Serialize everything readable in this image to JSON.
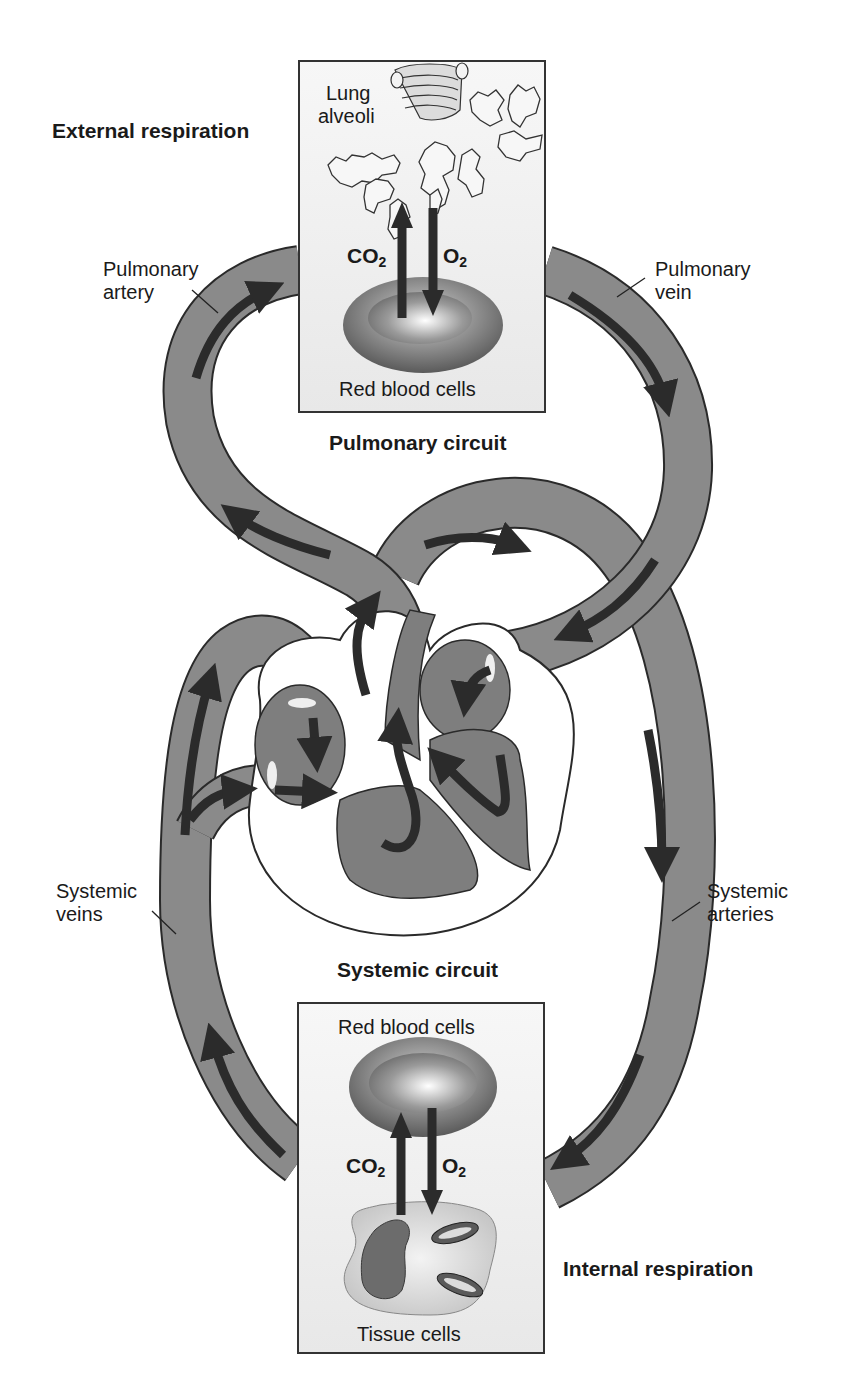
{
  "diagram": {
    "type": "circulatory-system",
    "colors": {
      "vessel_fill": "#8a8a8a",
      "vessel_stroke": "#2a2a2a",
      "arrow_fill": "#2b2b2b",
      "box_border": "#333333",
      "box_bg": "#f2f2f2",
      "background": "#ffffff"
    },
    "section_titles": {
      "external_respiration": "External respiration",
      "pulmonary_circuit": "Pulmonary circuit",
      "systemic_circuit": "Systemic circuit",
      "internal_respiration": "Internal respiration"
    },
    "vessel_labels": {
      "pulmonary_artery": [
        "Pulmonary",
        "artery"
      ],
      "pulmonary_vein": [
        "Pulmonary",
        "vein"
      ],
      "systemic_veins": [
        "Systemic",
        "veins"
      ],
      "systemic_arteries": [
        "Systemic",
        "arteries"
      ]
    },
    "top_box": {
      "structure_label": [
        "Lung",
        "alveoli"
      ],
      "cell_label": "Red blood cells",
      "gas_up": {
        "base": "CO",
        "sub": "2"
      },
      "gas_down": {
        "base": "O",
        "sub": "2"
      }
    },
    "bottom_box": {
      "cell_label": "Red blood cells",
      "tissue_label": "Tissue cells",
      "gas_up": {
        "base": "CO",
        "sub": "2"
      },
      "gas_down": {
        "base": "O",
        "sub": "2"
      }
    }
  }
}
